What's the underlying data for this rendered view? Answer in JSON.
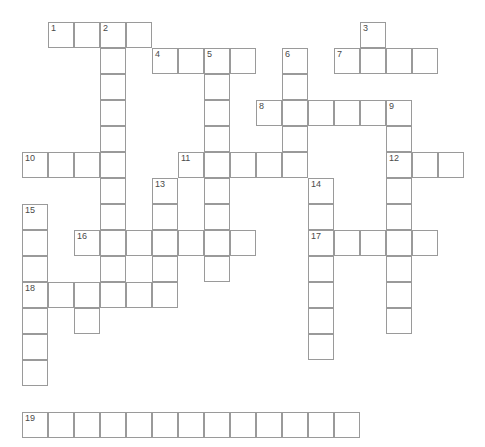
{
  "puzzle": {
    "title": "Crossword Grid",
    "grid": {
      "cell_size": 26,
      "origin_x": 22,
      "origin_y": 22,
      "columns": 18,
      "rows": 16,
      "border_color": "#9a9a9a",
      "cell_color": "#ffffff",
      "number_color": "#4a4a4a",
      "background": "#ffffff"
    },
    "clue_numbers": [
      1,
      2,
      3,
      4,
      5,
      6,
      7,
      8,
      9,
      10,
      11,
      12,
      13,
      14,
      15,
      16,
      17,
      18,
      19
    ],
    "entries": [
      {
        "number": 1,
        "direction": "across",
        "row": 0,
        "col": 1,
        "length": 4
      },
      {
        "number": 2,
        "direction": "down",
        "row": 0,
        "col": 3,
        "length": 12
      },
      {
        "number": 3,
        "direction": "down",
        "row": 0,
        "col": 13,
        "length": 2
      },
      {
        "number": 4,
        "direction": "across",
        "row": 1,
        "col": 5,
        "length": 4
      },
      {
        "number": 5,
        "direction": "down",
        "row": 1,
        "col": 7,
        "length": 9
      },
      {
        "number": 6,
        "direction": "down",
        "row": 1,
        "col": 10,
        "length": 4
      },
      {
        "number": 7,
        "direction": "across",
        "row": 1,
        "col": 12,
        "length": 4
      },
      {
        "number": 8,
        "direction": "across",
        "row": 3,
        "col": 9,
        "length": 6
      },
      {
        "number": 9,
        "direction": "down",
        "row": 3,
        "col": 14,
        "length": 9
      },
      {
        "number": 10,
        "direction": "across",
        "row": 5,
        "col": 0,
        "length": 4
      },
      {
        "number": 11,
        "direction": "across",
        "row": 5,
        "col": 6,
        "length": 5
      },
      {
        "number": 12,
        "direction": "across",
        "row": 5,
        "col": 14,
        "length": 3
      },
      {
        "number": 13,
        "direction": "down",
        "row": 6,
        "col": 5,
        "length": 4
      },
      {
        "number": 14,
        "direction": "down",
        "row": 6,
        "col": 11,
        "length": 7
      },
      {
        "number": 15,
        "direction": "down",
        "row": 7,
        "col": 0,
        "length": 9
      },
      {
        "number": 16,
        "direction": "across",
        "row": 8,
        "col": 2,
        "length": 7
      },
      {
        "number": 17,
        "direction": "across",
        "row": 8,
        "col": 11,
        "length": 5
      },
      {
        "number": 18,
        "direction": "across",
        "row": 10,
        "col": 0,
        "length": 6
      },
      {
        "number": 19,
        "direction": "across",
        "row": 15,
        "col": 0,
        "length": 13
      }
    ],
    "cells": [
      {
        "row": 0,
        "col": 1,
        "number": "1"
      },
      {
        "row": 0,
        "col": 2,
        "number": ""
      },
      {
        "row": 0,
        "col": 3,
        "number": "2"
      },
      {
        "row": 0,
        "col": 4,
        "number": ""
      },
      {
        "row": 0,
        "col": 13,
        "number": "3"
      },
      {
        "row": 1,
        "col": 3,
        "number": ""
      },
      {
        "row": 1,
        "col": 5,
        "number": "4"
      },
      {
        "row": 1,
        "col": 6,
        "number": ""
      },
      {
        "row": 1,
        "col": 7,
        "number": "5"
      },
      {
        "row": 1,
        "col": 8,
        "number": ""
      },
      {
        "row": 1,
        "col": 10,
        "number": "6"
      },
      {
        "row": 1,
        "col": 12,
        "number": "7"
      },
      {
        "row": 1,
        "col": 13,
        "number": ""
      },
      {
        "row": 1,
        "col": 14,
        "number": ""
      },
      {
        "row": 1,
        "col": 15,
        "number": ""
      },
      {
        "row": 2,
        "col": 3,
        "number": ""
      },
      {
        "row": 2,
        "col": 7,
        "number": ""
      },
      {
        "row": 2,
        "col": 10,
        "number": ""
      },
      {
        "row": 3,
        "col": 3,
        "number": ""
      },
      {
        "row": 3,
        "col": 7,
        "number": ""
      },
      {
        "row": 3,
        "col": 9,
        "number": "8"
      },
      {
        "row": 3,
        "col": 10,
        "number": ""
      },
      {
        "row": 3,
        "col": 11,
        "number": ""
      },
      {
        "row": 3,
        "col": 12,
        "number": ""
      },
      {
        "row": 3,
        "col": 13,
        "number": ""
      },
      {
        "row": 3,
        "col": 14,
        "number": "9"
      },
      {
        "row": 4,
        "col": 3,
        "number": ""
      },
      {
        "row": 4,
        "col": 7,
        "number": ""
      },
      {
        "row": 4,
        "col": 10,
        "number": ""
      },
      {
        "row": 4,
        "col": 14,
        "number": ""
      },
      {
        "row": 5,
        "col": 0,
        "number": "10"
      },
      {
        "row": 5,
        "col": 1,
        "number": ""
      },
      {
        "row": 5,
        "col": 2,
        "number": ""
      },
      {
        "row": 5,
        "col": 3,
        "number": ""
      },
      {
        "row": 5,
        "col": 6,
        "number": "11"
      },
      {
        "row": 5,
        "col": 7,
        "number": ""
      },
      {
        "row": 5,
        "col": 8,
        "number": ""
      },
      {
        "row": 5,
        "col": 9,
        "number": ""
      },
      {
        "row": 5,
        "col": 10,
        "number": ""
      },
      {
        "row": 5,
        "col": 14,
        "number": "12"
      },
      {
        "row": 5,
        "col": 15,
        "number": ""
      },
      {
        "row": 5,
        "col": 16,
        "number": ""
      },
      {
        "row": 6,
        "col": 3,
        "number": ""
      },
      {
        "row": 6,
        "col": 5,
        "number": "13"
      },
      {
        "row": 6,
        "col": 7,
        "number": ""
      },
      {
        "row": 6,
        "col": 11,
        "number": "14"
      },
      {
        "row": 6,
        "col": 14,
        "number": ""
      },
      {
        "row": 7,
        "col": 0,
        "number": "15"
      },
      {
        "row": 7,
        "col": 3,
        "number": ""
      },
      {
        "row": 7,
        "col": 5,
        "number": ""
      },
      {
        "row": 7,
        "col": 7,
        "number": ""
      },
      {
        "row": 7,
        "col": 11,
        "number": ""
      },
      {
        "row": 7,
        "col": 14,
        "number": ""
      },
      {
        "row": 8,
        "col": 0,
        "number": ""
      },
      {
        "row": 8,
        "col": 2,
        "number": "16"
      },
      {
        "row": 8,
        "col": 3,
        "number": ""
      },
      {
        "row": 8,
        "col": 4,
        "number": ""
      },
      {
        "row": 8,
        "col": 5,
        "number": ""
      },
      {
        "row": 8,
        "col": 6,
        "number": ""
      },
      {
        "row": 8,
        "col": 7,
        "number": ""
      },
      {
        "row": 8,
        "col": 8,
        "number": ""
      },
      {
        "row": 8,
        "col": 11,
        "number": "17"
      },
      {
        "row": 8,
        "col": 12,
        "number": ""
      },
      {
        "row": 8,
        "col": 13,
        "number": ""
      },
      {
        "row": 8,
        "col": 14,
        "number": ""
      },
      {
        "row": 8,
        "col": 15,
        "number": ""
      },
      {
        "row": 9,
        "col": 0,
        "number": ""
      },
      {
        "row": 9,
        "col": 3,
        "number": ""
      },
      {
        "row": 9,
        "col": 5,
        "number": ""
      },
      {
        "row": 9,
        "col": 7,
        "number": ""
      },
      {
        "row": 9,
        "col": 11,
        "number": ""
      },
      {
        "row": 9,
        "col": 14,
        "number": ""
      },
      {
        "row": 10,
        "col": 0,
        "number": "18"
      },
      {
        "row": 10,
        "col": 1,
        "number": ""
      },
      {
        "row": 10,
        "col": 2,
        "number": ""
      },
      {
        "row": 10,
        "col": 3,
        "number": ""
      },
      {
        "row": 10,
        "col": 4,
        "number": ""
      },
      {
        "row": 10,
        "col": 5,
        "number": ""
      },
      {
        "row": 10,
        "col": 11,
        "number": ""
      },
      {
        "row": 10,
        "col": 14,
        "number": ""
      },
      {
        "row": 11,
        "col": 0,
        "number": ""
      },
      {
        "row": 11,
        "col": 2,
        "number": ""
      },
      {
        "row": 11,
        "col": 11,
        "number": ""
      },
      {
        "row": 11,
        "col": 14,
        "number": ""
      },
      {
        "row": 12,
        "col": 0,
        "number": ""
      },
      {
        "row": 12,
        "col": 11,
        "number": ""
      },
      {
        "row": 13,
        "col": 0,
        "number": ""
      },
      {
        "row": 15,
        "col": 0,
        "number": "19"
      },
      {
        "row": 15,
        "col": 1,
        "number": ""
      },
      {
        "row": 15,
        "col": 2,
        "number": ""
      },
      {
        "row": 15,
        "col": 3,
        "number": ""
      },
      {
        "row": 15,
        "col": 4,
        "number": ""
      },
      {
        "row": 15,
        "col": 5,
        "number": ""
      },
      {
        "row": 15,
        "col": 6,
        "number": ""
      },
      {
        "row": 15,
        "col": 7,
        "number": ""
      },
      {
        "row": 15,
        "col": 8,
        "number": ""
      },
      {
        "row": 15,
        "col": 9,
        "number": ""
      },
      {
        "row": 15,
        "col": 10,
        "number": ""
      },
      {
        "row": 15,
        "col": 11,
        "number": ""
      },
      {
        "row": 15,
        "col": 12,
        "number": ""
      }
    ]
  }
}
